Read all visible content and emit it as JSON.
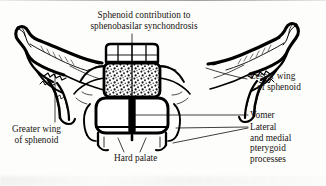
{
  "figure": {
    "kind": "anatomical-line-drawing",
    "ink_color": "#000000",
    "background_color": "#fdfdfc"
  },
  "title": {
    "line1": "Sphenoid contribution to",
    "line2": "sphenobasilar synchondrosis"
  },
  "labels": {
    "lesser_wing": {
      "line1": "Lesser wing",
      "line2": "of sphenoid"
    },
    "vomer": {
      "line1": "Vomer"
    },
    "pterygoid": {
      "line1": "Lateral",
      "line2": "and medial",
      "line3": "pterygoid",
      "line4": "processes"
    },
    "greater_wing": {
      "line1": "Greater wing",
      "line2": "of sphenoid"
    },
    "hard_palate": {
      "line1": "Hard palate"
    }
  }
}
